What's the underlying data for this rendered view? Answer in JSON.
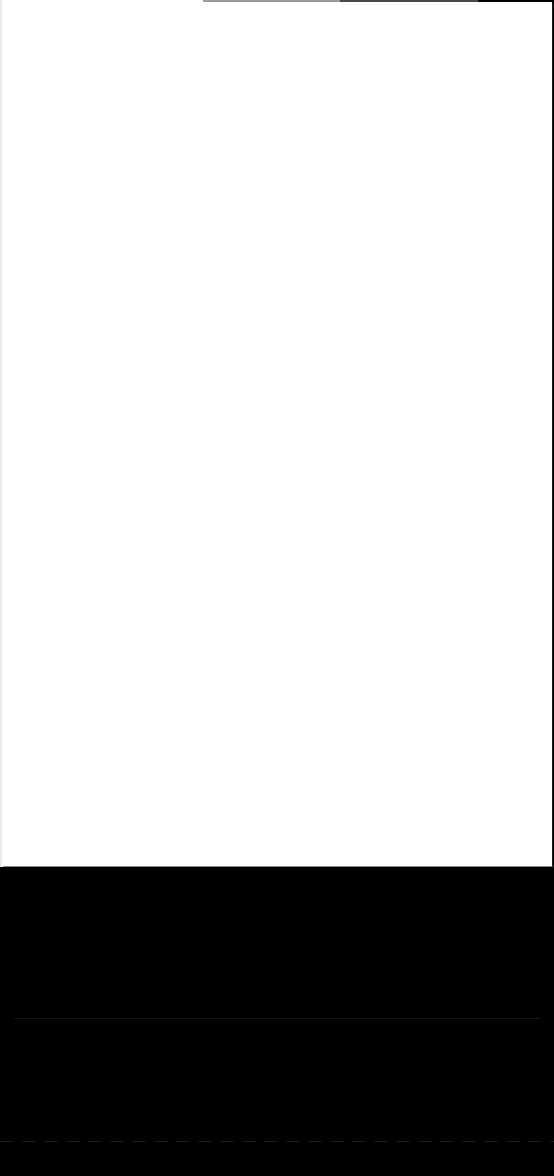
{
  "screen": {
    "content_background": "#ffffff",
    "bottom_background": "#000000"
  },
  "progress_bar": {
    "segments": [
      {
        "color": "#9a9a9a"
      },
      {
        "color": "#4a4a4a"
      },
      {
        "color": "#000000"
      }
    ]
  },
  "bottom_panel": {
    "footer_text": ""
  }
}
